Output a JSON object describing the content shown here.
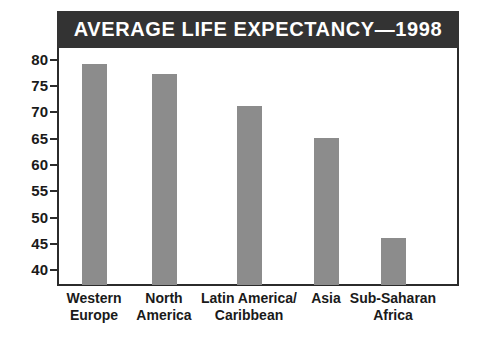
{
  "chart_data": {
    "type": "bar",
    "title": "AVERAGE LIFE EXPECTANCY—1998",
    "xlabel": "",
    "ylabel": "",
    "categories": [
      "Western Europe",
      "North America",
      "Latin America/ Caribbean",
      "Asia",
      "Sub-Saharan Africa"
    ],
    "category_lines": [
      [
        "Western",
        "Europe"
      ],
      [
        "North",
        "America"
      ],
      [
        "Latin America/",
        "Caribbean"
      ],
      [
        "Asia",
        ""
      ],
      [
        "Sub-Saharan",
        "Africa"
      ]
    ],
    "values": [
      79,
      77,
      71,
      65,
      46
    ],
    "ylim": [
      37,
      82
    ],
    "yticks": [
      80,
      75,
      70,
      65,
      60,
      55,
      50,
      45,
      40
    ],
    "ytick_labels": [
      "80",
      "75",
      "70",
      "65",
      "60",
      "55",
      "50",
      "45",
      "40"
    ],
    "grid": false,
    "legend": null,
    "colors": {
      "bar": "#8c8c8c",
      "title_bar_background": "#333333",
      "title_text": "#ffffff",
      "axis": "#2b2b2b",
      "tick_label": "#1a1a1a",
      "plot_background": "#ffffff"
    }
  }
}
